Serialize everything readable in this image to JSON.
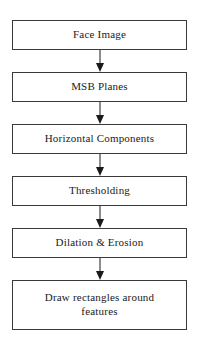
{
  "diagram": {
    "type": "flowchart",
    "orientation": "vertical",
    "title": "",
    "background_color": "#ffffff",
    "node_border_color": "#3a3a3a",
    "node_fill_color": "#ffffff",
    "text_color": "#1a1a1a",
    "arrow_color": "#1a1a1a",
    "nodes": [
      {
        "id": "face-image",
        "label": "Face Image",
        "lines": 1
      },
      {
        "id": "msb-planes",
        "label": "MSB Planes",
        "lines": 1
      },
      {
        "id": "horizontal-components",
        "label": "Horizontal Components",
        "lines": 1
      },
      {
        "id": "thresholding",
        "label": "Thresholding",
        "lines": 1
      },
      {
        "id": "dilation-erosion",
        "label": "Dilation & Erosion",
        "lines": 1
      },
      {
        "id": "draw-rectangles",
        "label": "Draw rectangles around\nfeatures",
        "lines": 2
      }
    ],
    "edges": [
      {
        "from": "face-image",
        "to": "msb-planes",
        "direction": "down",
        "label": ""
      },
      {
        "from": "msb-planes",
        "to": "horizontal-components",
        "direction": "down",
        "label": ""
      },
      {
        "from": "horizontal-components",
        "to": "thresholding",
        "direction": "down",
        "label": ""
      },
      {
        "from": "thresholding",
        "to": "dilation-erosion",
        "direction": "down",
        "label": ""
      },
      {
        "from": "dilation-erosion",
        "to": "draw-rectangles",
        "direction": "down",
        "label": ""
      }
    ]
  }
}
